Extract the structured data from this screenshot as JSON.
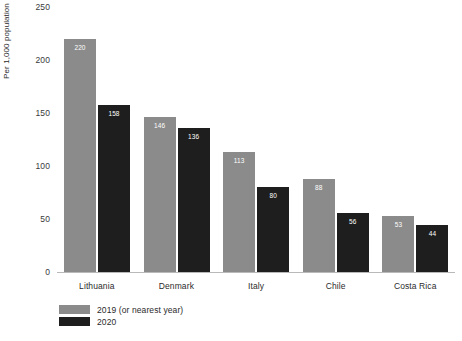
{
  "chart_data": {
    "type": "bar",
    "title": "",
    "xlabel": "",
    "ylabel": "Per 1,000 population",
    "ylim": [
      0,
      250
    ],
    "yticks": [
      0,
      50,
      100,
      150,
      200,
      250
    ],
    "grid": false,
    "legend_position": "bottom-left",
    "categories": [
      "Lithuania",
      "Denmark",
      "Italy",
      "Chile",
      "Costa Rica"
    ],
    "series": [
      {
        "name": "2019 (or nearest year)",
        "color": "#8b8b8b",
        "values": [
          220,
          146,
          113,
          88,
          53
        ]
      },
      {
        "name": "2020",
        "color": "#1e1e1e",
        "values": [
          158,
          136,
          80,
          56,
          44
        ]
      }
    ]
  }
}
